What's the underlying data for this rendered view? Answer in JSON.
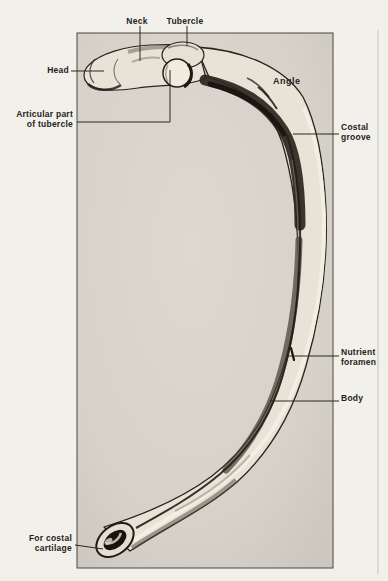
{
  "figure": {
    "labels": {
      "neck": "Neck",
      "tubercle": "Tubercle",
      "head": "Head",
      "articular": "Articular part\nof tubercle",
      "angle": "Angle",
      "costal_groove": "Costal\ngroove",
      "nutrient_foramen": "Nutrient\nforamen",
      "body": "Body",
      "for_costal_cartilage": "For costal\ncartilage"
    },
    "colors": {
      "page_background": "#f2f0ea",
      "photo_background": "#d8d4cc",
      "ink": "#26221d",
      "bone_light": "#e8e3d6",
      "bone_shadow": "#2b2620",
      "leader_line": "#2a2622",
      "frame_border": "#4a463f"
    }
  }
}
